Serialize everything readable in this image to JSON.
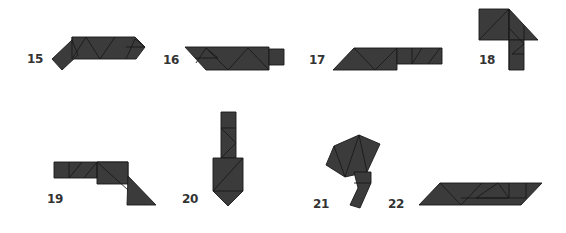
{
  "puzzles": [
    {
      "number": "15",
      "label_x": 27,
      "label_y": 52
    },
    {
      "number": "16",
      "label_x": 163,
      "label_y": 53
    },
    {
      "number": "17",
      "label_x": 309,
      "label_y": 53
    },
    {
      "number": "18",
      "label_x": 479,
      "label_y": 53
    },
    {
      "number": "19",
      "label_x": 47,
      "label_y": 192
    },
    {
      "number": "20",
      "label_x": 182,
      "label_y": 192
    },
    {
      "number": "21",
      "label_x": 313,
      "label_y": 197
    },
    {
      "number": "22",
      "label_x": 388,
      "label_y": 197
    }
  ],
  "colors": {
    "piece_fill": "#3b3b3b",
    "piece_edge": "#1a1a1a",
    "label": "#333333",
    "background": "#ffffff"
  }
}
